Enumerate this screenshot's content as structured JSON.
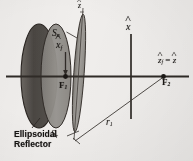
{
  "figure": {
    "kind": "ellipsoidal-reflector-geometry-diagram",
    "background_color": "#f3f1ef",
    "ink_color": "#15120f"
  },
  "labels": {
    "aperture_surface": "S",
    "aperture_surface_sub": "a",
    "reflector_surface": "S",
    "reflector_surface_sub": "r",
    "focus_near": "F",
    "focus_near_sub": "1",
    "focus_far": "F",
    "focus_far_sub": "2",
    "x_feed_axis": "x",
    "x_feed_axis_sub": "f",
    "x_axis": "x",
    "z_feed_axis": "z",
    "z_feed_axis_sub": "f",
    "z_equals": "=",
    "z_axis": "z",
    "radius": "r",
    "radius_sub": "1",
    "small_z_tick": "z",
    "caption_line1": "Ellipsoidal",
    "caption_line2": "Reflector"
  },
  "shapes": {
    "outer_reflector_fill": "#4f4b47",
    "inner_reflector_fill": "#8d8a85",
    "blade_fill": "#9a9792",
    "axis_color": "#2a2622"
  }
}
